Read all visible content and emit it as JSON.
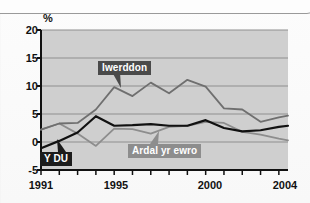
{
  "chart_data": {
    "type": "line",
    "title": "",
    "xlabel": "",
    "ylabel": "%",
    "unit_label": "%",
    "xlim": [
      1991,
      2004.5
    ],
    "ylim": [
      -5,
      20
    ],
    "yticks": [
      20,
      15,
      10,
      5,
      0,
      -5
    ],
    "ytick_labels": [
      "20",
      "15",
      "10",
      "5",
      "0",
      "-5"
    ],
    "xticks": [
      1991,
      1992,
      1993,
      1994,
      1995,
      1996,
      1997,
      1998,
      1999,
      2000,
      2001,
      2002,
      2003,
      2004
    ],
    "xtick_labels_shown": [
      "1991",
      "1995",
      "2000",
      "2004"
    ],
    "grid": "horizontal",
    "legend_position": "inline-annotations",
    "plot_background": "#cfcfcf",
    "x": [
      1991,
      1992,
      1993,
      1994,
      1995,
      1996,
      1997,
      1998,
      1999,
      2000,
      2001,
      2002,
      2003,
      2004,
      2004.5
    ],
    "series": [
      {
        "name": "Iwerddon",
        "color": "#6f6f6f",
        "values": [
          2.2,
          3.3,
          3.4,
          5.8,
          9.8,
          8.2,
          10.6,
          8.7,
          11.1,
          9.9,
          6.0,
          5.8,
          3.6,
          4.4,
          4.7
        ]
      },
      {
        "name": "Y DU",
        "color": "#111111",
        "values": [
          -1.1,
          0.2,
          1.7,
          4.6,
          2.9,
          3.0,
          3.2,
          2.9,
          2.9,
          3.9,
          2.5,
          1.9,
          2.1,
          2.7,
          2.9
        ]
      },
      {
        "name": "Ardal yr ewro",
        "color": "#8d8d8d",
        "values": [
          2.2,
          3.3,
          1.5,
          -0.7,
          2.4,
          2.3,
          1.5,
          2.7,
          2.9,
          3.6,
          3.4,
          1.8,
          1.3,
          0.6,
          0.3
        ]
      }
    ],
    "annotations": [
      {
        "label": "Iwerddon",
        "points_to_year": 1995,
        "points_to_value": 9.8,
        "style": "dark-box"
      },
      {
        "label": "Y DU",
        "points_to_year": 1992,
        "points_to_value": 0.2,
        "style": "black-box"
      },
      {
        "label": "Ardal yr ewro",
        "points_to_year": 1998,
        "points_to_value": 2.2,
        "style": "gray-box"
      }
    ]
  },
  "labels": {
    "unit": "%",
    "ireland": "Iwerddon",
    "uk": "Y DU",
    "euro": "Ardal yr ewro"
  }
}
